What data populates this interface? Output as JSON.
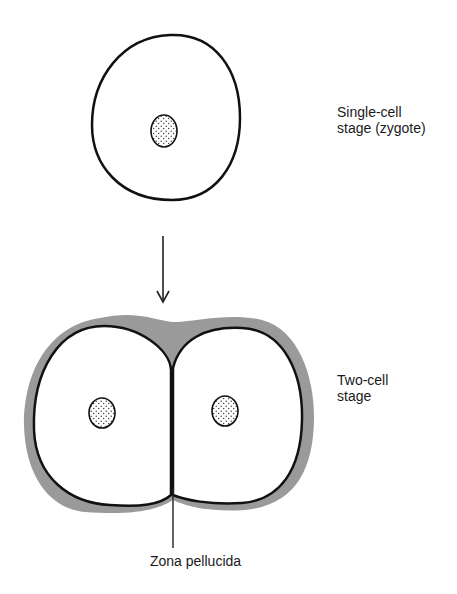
{
  "diagram": {
    "type": "biological-illustration",
    "colors": {
      "background": "#ffffff",
      "outline": "#111111",
      "zona_pellucida": "#9a9a9a",
      "cell_fill": "#ffffff",
      "nucleus_stipple": "#333333"
    },
    "stages": [
      {
        "id": "single-cell",
        "label_lines": [
          "Single-cell",
          "stage (zygote)"
        ],
        "cell_count": 1
      },
      {
        "id": "two-cell",
        "label_lines": [
          "Two-cell",
          "stage"
        ],
        "cell_count": 2
      }
    ],
    "arrow": {
      "from": "single-cell",
      "to": "two-cell",
      "direction": "down"
    },
    "annotation": {
      "label": "Zona pellucida",
      "points_to": "gray layer surrounding the two-cell embryo"
    }
  }
}
